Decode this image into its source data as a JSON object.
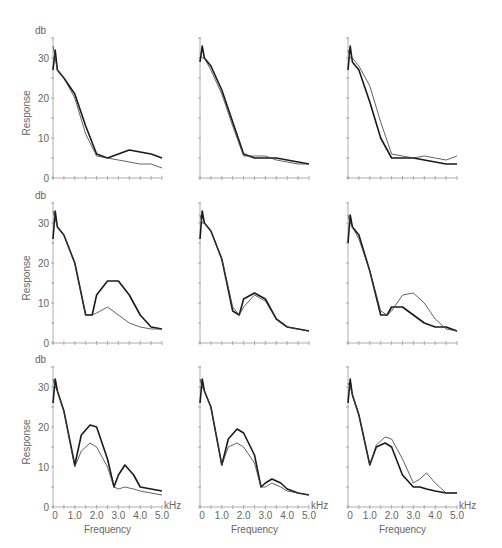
{
  "figure": {
    "y_unit": "db",
    "y_label": "Response",
    "x_label": "Frequency",
    "x_unit": "kHz",
    "x_ticks": [
      "0",
      "1.0",
      "2.0",
      "3.0",
      "4.0",
      "5.0"
    ],
    "y_ticks": [
      "0",
      "10",
      "20",
      "30"
    ]
  },
  "chart_data": [
    {
      "type": "line",
      "panel": "row1-col1",
      "xlabel": "Frequency (kHz)",
      "ylabel": "Response (db)",
      "xlim": [
        0,
        5
      ],
      "ylim": [
        0,
        35
      ],
      "x": [
        0,
        0.1,
        0.2,
        0.5,
        1.0,
        1.5,
        2.0,
        2.5,
        3.0,
        3.5,
        4.0,
        4.5,
        5.0
      ],
      "series": [
        {
          "name": "thick",
          "values": [
            27,
            32,
            27,
            25,
            21,
            13,
            6,
            5,
            6,
            7,
            6.5,
            6,
            5
          ]
        },
        {
          "name": "thin",
          "values": [
            33,
            30,
            27,
            25,
            20,
            11,
            5.5,
            5,
            4.5,
            4,
            3.5,
            3.5,
            2.5
          ]
        }
      ]
    },
    {
      "type": "line",
      "panel": "row1-col2",
      "xlabel": "Frequency (kHz)",
      "ylabel": "Response (db)",
      "xlim": [
        0,
        5
      ],
      "ylim": [
        0,
        35
      ],
      "x": [
        0,
        0.1,
        0.2,
        0.5,
        1.0,
        1.5,
        2.0,
        2.5,
        3.0,
        3.5,
        4.0,
        4.5,
        5.0
      ],
      "series": [
        {
          "name": "thick",
          "values": [
            29,
            33,
            30,
            28,
            22,
            14,
            6,
            5,
            5,
            5,
            4.5,
            4,
            3.5
          ]
        },
        {
          "name": "thin",
          "values": [
            31,
            30,
            30,
            27,
            21,
            13,
            5.5,
            5.5,
            5.5,
            4.5,
            4,
            3.5,
            3.5
          ]
        }
      ]
    },
    {
      "type": "line",
      "panel": "row1-col3",
      "xlabel": "Frequency (kHz)",
      "ylabel": "Response (db)",
      "xlim": [
        0,
        5
      ],
      "ylim": [
        0,
        35
      ],
      "x": [
        0,
        0.1,
        0.2,
        0.5,
        1.0,
        1.5,
        2.0,
        2.5,
        3.0,
        3.5,
        4.0,
        4.5,
        5.0
      ],
      "series": [
        {
          "name": "thick",
          "values": [
            27,
            33,
            29,
            27,
            19,
            10,
            5,
            5,
            5,
            4.5,
            4,
            3.5,
            3.5
          ]
        },
        {
          "name": "thin",
          "values": [
            32,
            30,
            30,
            28,
            23,
            14,
            6,
            5.5,
            5,
            5.5,
            5,
            4.5,
            5.5
          ]
        }
      ]
    },
    {
      "type": "line",
      "panel": "row2-col1",
      "xlabel": "Frequency (kHz)",
      "ylabel": "Response (db)",
      "xlim": [
        0,
        5
      ],
      "ylim": [
        0,
        35
      ],
      "x": [
        0,
        0.1,
        0.2,
        0.5,
        1.0,
        1.5,
        1.8,
        2.0,
        2.5,
        3.0,
        3.5,
        4.0,
        4.5,
        5.0
      ],
      "series": [
        {
          "name": "thick",
          "values": [
            26,
            33,
            29,
            27,
            20,
            7,
            7,
            12,
            15.5,
            15.5,
            12,
            7,
            4,
            3.5
          ]
        },
        {
          "name": "thin",
          "values": [
            33,
            31,
            29,
            27,
            20,
            7,
            7,
            7.5,
            9,
            7,
            5,
            4,
            3.5,
            3.5
          ]
        }
      ]
    },
    {
      "type": "line",
      "panel": "row2-col2",
      "xlabel": "Frequency (kHz)",
      "ylabel": "Response (db)",
      "xlim": [
        0,
        5
      ],
      "ylim": [
        0,
        35
      ],
      "x": [
        0,
        0.1,
        0.2,
        0.5,
        1.0,
        1.5,
        1.8,
        2.0,
        2.5,
        3.0,
        3.5,
        4.0,
        4.5,
        5.0
      ],
      "series": [
        {
          "name": "thick",
          "values": [
            26,
            33,
            30,
            28,
            21,
            8,
            7,
            11,
            12.5,
            11,
            6,
            4,
            3.5,
            3
          ]
        },
        {
          "name": "thin",
          "values": [
            32,
            30,
            30,
            28,
            21,
            9,
            7,
            9,
            12,
            10.5,
            6,
            4,
            3.5,
            3
          ]
        }
      ]
    },
    {
      "type": "line",
      "panel": "row2-col3",
      "xlabel": "Frequency (kHz)",
      "ylabel": "Response (db)",
      "xlim": [
        0,
        5
      ],
      "ylim": [
        0,
        35
      ],
      "x": [
        0,
        0.1,
        0.2,
        0.5,
        1.0,
        1.5,
        1.8,
        2.0,
        2.5,
        3.0,
        3.5,
        4.0,
        4.5,
        5.0
      ],
      "series": [
        {
          "name": "thick",
          "values": [
            25,
            32,
            29,
            27,
            18,
            7,
            7,
            9,
            9,
            7,
            5,
            4,
            4,
            3
          ]
        },
        {
          "name": "thin",
          "values": [
            32,
            30,
            29,
            26,
            18,
            8,
            7,
            8,
            12,
            12.5,
            10,
            6,
            3.5,
            3
          ]
        }
      ]
    },
    {
      "type": "line",
      "panel": "row3-col1",
      "xlabel": "Frequency (kHz)",
      "ylabel": "Response (db)",
      "xlim": [
        0,
        5
      ],
      "ylim": [
        0,
        35
      ],
      "x": [
        0,
        0.1,
        0.2,
        0.5,
        1.0,
        1.3,
        1.7,
        2.0,
        2.5,
        2.8,
        3.0,
        3.3,
        3.7,
        4.0,
        4.5,
        5.0
      ],
      "series": [
        {
          "name": "thick",
          "values": [
            26,
            32,
            29,
            24,
            10.5,
            18,
            20.5,
            20,
            12,
            5,
            8,
            10.5,
            8,
            5,
            4.5,
            4
          ]
        },
        {
          "name": "thin",
          "values": [
            32,
            30,
            29,
            24,
            10,
            14,
            16,
            15,
            10,
            5,
            4.5,
            5,
            4.5,
            4,
            3.5,
            3
          ]
        }
      ]
    },
    {
      "type": "line",
      "panel": "row3-col2",
      "xlabel": "Frequency (kHz)",
      "ylabel": "Response (db)",
      "xlim": [
        0,
        5
      ],
      "ylim": [
        0,
        35
      ],
      "x": [
        0,
        0.1,
        0.2,
        0.5,
        1.0,
        1.3,
        1.7,
        2.0,
        2.5,
        2.8,
        3.0,
        3.3,
        3.7,
        4.0,
        4.5,
        5.0
      ],
      "series": [
        {
          "name": "thick",
          "values": [
            26,
            32,
            29,
            25,
            10.5,
            17,
            19.5,
            18.5,
            13,
            5,
            6,
            7,
            6,
            4.5,
            3.5,
            3
          ]
        },
        {
          "name": "thin",
          "values": [
            32,
            30,
            29,
            25,
            10.5,
            15,
            16,
            15,
            11,
            5,
            5,
            6,
            5,
            4,
            3.5,
            3
          ]
        }
      ]
    },
    {
      "type": "line",
      "panel": "row3-col3",
      "xlabel": "Frequency (kHz)",
      "ylabel": "Response (db)",
      "xlim": [
        0,
        5
      ],
      "ylim": [
        0,
        35
      ],
      "x": [
        0,
        0.1,
        0.2,
        0.5,
        1.0,
        1.3,
        1.7,
        2.0,
        2.5,
        3.0,
        3.3,
        3.6,
        4.0,
        4.5,
        5.0
      ],
      "series": [
        {
          "name": "thick",
          "values": [
            26,
            32,
            28,
            23,
            10.5,
            15,
            16,
            15,
            8,
            5,
            5,
            4.5,
            4,
            3.5,
            3.5
          ]
        },
        {
          "name": "thin",
          "values": [
            31,
            30,
            28,
            23,
            10.5,
            15.5,
            17.5,
            17,
            12,
            6,
            7,
            8.5,
            6,
            3.5,
            3.5
          ]
        }
      ]
    }
  ]
}
